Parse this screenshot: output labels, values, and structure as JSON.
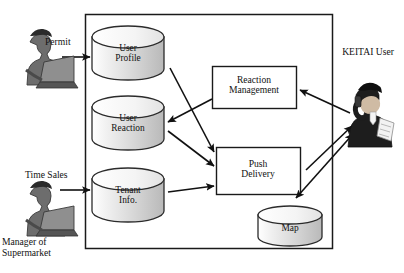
{
  "diagram": {
    "boundary": {
      "name": "system-boundary",
      "stroke": "#1a1a1a"
    },
    "datastores": [
      {
        "id": "user-profile",
        "label": "User\nProfile",
        "x": 92,
        "y": 26,
        "w": 72,
        "h": 54
      },
      {
        "id": "user-reaction",
        "label": "User\nReaction",
        "x": 92,
        "y": 96,
        "w": 72,
        "h": 54
      },
      {
        "id": "tenant-info",
        "label": "Tenant\nInfo.",
        "x": 92,
        "y": 168,
        "w": 72,
        "h": 54
      },
      {
        "id": "map",
        "label": "Map",
        "x": 258,
        "y": 206,
        "w": 64,
        "h": 42
      }
    ],
    "processes": [
      {
        "id": "reaction-management",
        "label": "Reaction\nManagement",
        "x": 212,
        "y": 66,
        "w": 84,
        "h": 42
      },
      {
        "id": "push-delivery",
        "label": "Push\nDelivery",
        "x": 216,
        "y": 147,
        "w": 84,
        "h": 47
      }
    ],
    "actors": [
      {
        "id": "permit-user",
        "label": "",
        "x": 10,
        "y": 34,
        "w": 66,
        "h": 52
      },
      {
        "id": "supermarket-manager",
        "label": "Manager of\nSupermarket",
        "x": 10,
        "y": 185,
        "w": 66,
        "h": 52
      },
      {
        "id": "keitai-user",
        "label": "KEITAI User",
        "x": 348,
        "y": 75,
        "w": 48,
        "h": 60
      }
    ],
    "edge_labels": [
      {
        "id": "permit-label",
        "text": "Permit",
        "x": 45,
        "y": 36
      },
      {
        "id": "time-sales-label",
        "text": "Time Sales",
        "x": 25,
        "y": 169
      }
    ],
    "flows": [
      {
        "from": "permit-user",
        "to": "user-profile",
        "label": "Permit"
      },
      {
        "from": "supermarket-manager",
        "to": "tenant-info",
        "label": "Time Sales"
      },
      {
        "from": "reaction-management",
        "to": "user-reaction",
        "label": ""
      },
      {
        "from": "user-profile",
        "to": "push-delivery",
        "label": ""
      },
      {
        "from": "user-reaction",
        "to": "push-delivery",
        "label": ""
      },
      {
        "from": "tenant-info",
        "to": "push-delivery",
        "label": ""
      },
      {
        "from": "keitai-user",
        "to": "reaction-management",
        "label": ""
      },
      {
        "from": "push-delivery",
        "to": "keitai-user",
        "label": ""
      },
      {
        "from": "keitai-user",
        "to": "map",
        "label": ""
      }
    ]
  }
}
